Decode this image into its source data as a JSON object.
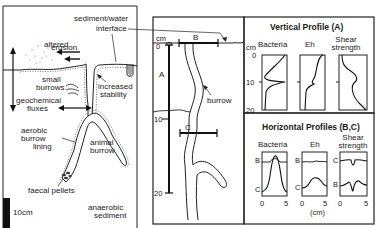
{
  "left_panel": {
    "labels": {
      "sediment_water_interface_1": "sediment/water",
      "sediment_water_interface_2": "interface",
      "altered_erosion_1": "altered",
      "altered_erosion_2": "erosion",
      "small_burrows_1": "small",
      "small_burrows_2": "burrows",
      "increased_stability_1": "increased",
      "increased_stability_2": "stability",
      "geochemical_fluxes_1": "geochemical",
      "geochemical_fluxes_2": "fluxes",
      "aerobic_lining_1": "aerobic",
      "aerobic_lining_2": "burrow",
      "aerobic_lining_3": "lining",
      "animal_burrow_1": "animal",
      "animal_burrow_2": "burrow",
      "faecal_pellets": "faecal pellets",
      "scale_bar": "10cm",
      "anaerobic_1": "anaerobic",
      "anaerobic_2": "sediment"
    }
  },
  "middle_panel": {
    "unit": "cm",
    "depth_ticks": [
      "0",
      "10",
      "20"
    ],
    "transect_labels": {
      "vertical": "A",
      "horizontal_top": "B",
      "horizontal_mid": "C"
    },
    "burrow_label": "burrow"
  },
  "vertical_profile": {
    "title": "Vertical Profile (A)",
    "unit": "cm",
    "depth_ticks": [
      "0",
      "10",
      "20"
    ],
    "plots": [
      {
        "name": "Bacteria"
      },
      {
        "name": "Eh"
      },
      {
        "name_1": "Shear",
        "name_2": "strength"
      }
    ]
  },
  "horizontal_profiles": {
    "title": "Horizontal Profiles (B,C)",
    "x_ticks": [
      "0",
      "5"
    ],
    "x_unit": "(cm)",
    "plots": [
      {
        "name": "Bacteria",
        "top_label": "B",
        "bottom_label": "C"
      },
      {
        "name": "Eh",
        "top_label": "B",
        "bottom_label": "C"
      },
      {
        "name_1": "Shear",
        "name_2": "strength",
        "top_label": "C",
        "bottom_label": "B"
      }
    ]
  }
}
